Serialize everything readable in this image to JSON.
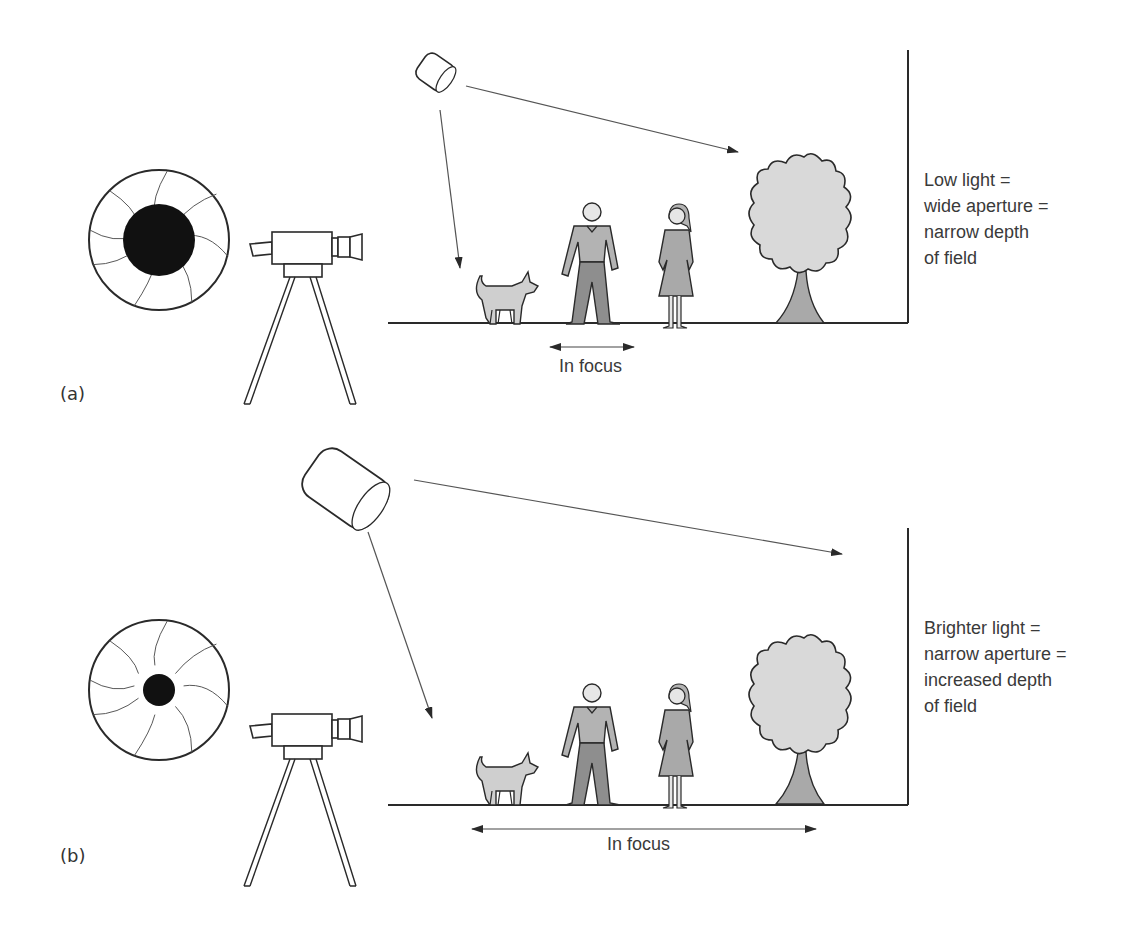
{
  "colors": {
    "background": "#ffffff",
    "line": "#2a2a2a",
    "ray": "#555555",
    "aperture_dark": "#111111",
    "figure_light": "#cfcfcf",
    "figure_mid": "#a9a9a9",
    "figure_dark": "#8e8e8e",
    "text": "#3a3a3a"
  },
  "panels": [
    {
      "id": "a",
      "panel_label": "(a)",
      "aperture": {
        "state": "wide",
        "opening_radius": 46
      },
      "caption_lines": [
        "Low light =",
        "wide aperture =",
        "narrow depth",
        "of field"
      ],
      "focus_label": "In focus",
      "focus_range": {
        "x1": 548,
        "x2": 636
      },
      "light_size": "small"
    },
    {
      "id": "b",
      "panel_label": "(b)",
      "aperture": {
        "state": "narrow",
        "opening_radius": 16
      },
      "caption_lines": [
        "Brighter light =",
        "narrow aperture =",
        "increased depth",
        "of field"
      ],
      "focus_label": "In focus",
      "focus_range": {
        "x1": 470,
        "x2": 818
      },
      "light_size": "large"
    }
  ],
  "scene_objects": [
    "camera-on-tripod",
    "light",
    "dog",
    "man",
    "woman",
    "tree",
    "wall"
  ]
}
